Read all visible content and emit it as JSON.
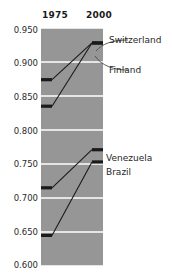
{
  "chart_data": {
    "type": "line",
    "title": "",
    "xlabel": "",
    "ylabel": "",
    "categories": [
      "1975",
      "2000"
    ],
    "x": [
      1975,
      2000
    ],
    "ylim": [
      0.6,
      0.95
    ],
    "yticks": [
      "0.950",
      "0.900",
      "0.850",
      "0.800",
      "0.750",
      "0.700",
      "0.650",
      "0.600"
    ],
    "ytick_values": [
      0.95,
      0.9,
      0.85,
      0.8,
      0.75,
      0.7,
      0.65,
      0.6
    ],
    "grid": true,
    "legend_position": "right-inline-labels",
    "plot_background": "#969696",
    "gridline_color": "#ffffff",
    "line_color": "#1a1a1a",
    "series": [
      {
        "name": "Switzerland",
        "values": [
          0.874,
          0.928
        ]
      },
      {
        "name": "Finland",
        "values": [
          0.835,
          0.928
        ]
      },
      {
        "name": "Venezuela",
        "values": [
          0.715,
          0.771
        ]
      },
      {
        "name": "Brazil",
        "values": [
          0.645,
          0.753
        ]
      }
    ]
  },
  "header": {
    "left_year": "1975",
    "right_year": "2000"
  },
  "labels": {
    "switzerland": "Switzerland",
    "finland": "Finland",
    "venezuela": "Venezuela",
    "brazil": "Brazil"
  },
  "yticks": {
    "t0": "0.950",
    "t1": "0.900",
    "t2": "0.850",
    "t3": "0.800",
    "t4": "0.750",
    "t5": "0.700",
    "t6": "0.650",
    "t7": "0.600"
  }
}
